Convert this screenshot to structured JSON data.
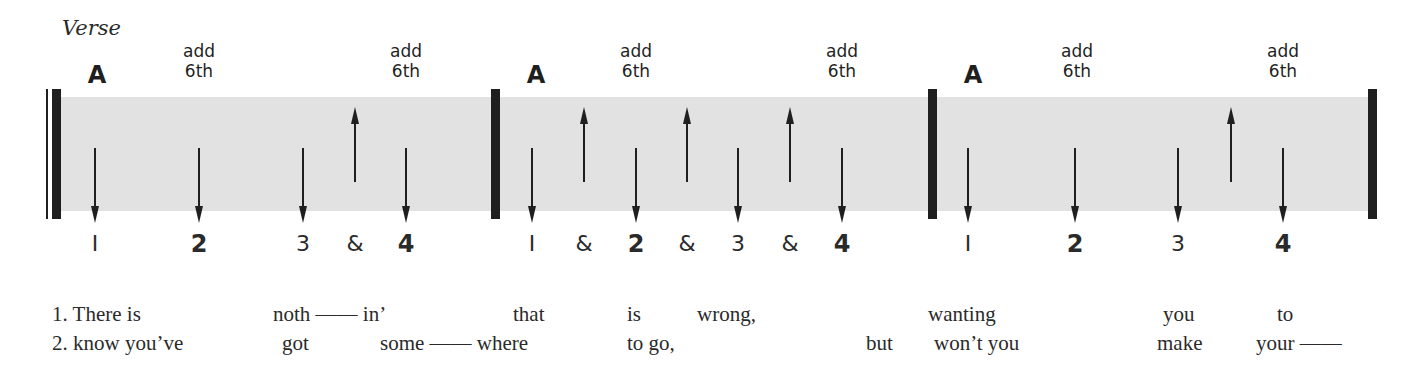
{
  "section_label": "Verse",
  "colors": {
    "band": "#e2e2e2",
    "ink": "#1f1f1f"
  },
  "bars": [
    {
      "chords": [
        {
          "name": "A",
          "x": 97,
          "type": "root"
        },
        {
          "name": "add\n6th",
          "line1": "add",
          "line2": "6th",
          "x": 199,
          "type": "ext"
        },
        {
          "line1": "add",
          "line2": "6th",
          "x": 406,
          "type": "ext"
        }
      ],
      "strums": [
        {
          "dir": "down",
          "x": 95
        },
        {
          "dir": "down",
          "x": 199
        },
        {
          "dir": "down",
          "x": 303
        },
        {
          "dir": "up",
          "x": 355
        },
        {
          "dir": "down",
          "x": 406
        }
      ],
      "beats": [
        {
          "label": "1",
          "x": 95,
          "strong": false
        },
        {
          "label": "2",
          "x": 199,
          "strong": true
        },
        {
          "label": "3",
          "x": 303,
          "strong": false
        },
        {
          "label": "&",
          "x": 355,
          "strong": false
        },
        {
          "label": "4",
          "x": 406,
          "strong": true
        }
      ]
    },
    {
      "chords": [
        {
          "name": "A",
          "x": 536,
          "type": "root"
        },
        {
          "line1": "add",
          "line2": "6th",
          "x": 636,
          "type": "ext"
        },
        {
          "line1": "add",
          "line2": "6th",
          "x": 842,
          "type": "ext"
        }
      ],
      "strums": [
        {
          "dir": "down",
          "x": 532
        },
        {
          "dir": "up",
          "x": 584
        },
        {
          "dir": "down",
          "x": 636
        },
        {
          "dir": "up",
          "x": 687
        },
        {
          "dir": "down",
          "x": 738
        },
        {
          "dir": "up",
          "x": 790
        },
        {
          "dir": "down",
          "x": 842
        }
      ],
      "beats": [
        {
          "label": "1",
          "x": 532,
          "strong": false
        },
        {
          "label": "&",
          "x": 584,
          "strong": false
        },
        {
          "label": "2",
          "x": 636,
          "strong": true
        },
        {
          "label": "&",
          "x": 687,
          "strong": false
        },
        {
          "label": "3",
          "x": 738,
          "strong": false
        },
        {
          "label": "&",
          "x": 790,
          "strong": false
        },
        {
          "label": "4",
          "x": 842,
          "strong": true
        }
      ]
    },
    {
      "chords": [
        {
          "name": "A",
          "x": 973,
          "type": "root"
        },
        {
          "line1": "add",
          "line2": "6th",
          "x": 1077,
          "type": "ext"
        },
        {
          "line1": "add",
          "line2": "6th",
          "x": 1283,
          "type": "ext"
        }
      ],
      "strums": [
        {
          "dir": "down",
          "x": 968
        },
        {
          "dir": "down",
          "x": 1075
        },
        {
          "dir": "down",
          "x": 1178
        },
        {
          "dir": "up",
          "x": 1231
        },
        {
          "dir": "down",
          "x": 1283
        }
      ],
      "beats": [
        {
          "label": "1",
          "x": 968,
          "strong": false
        },
        {
          "label": "2",
          "x": 1075,
          "strong": true
        },
        {
          "label": "3",
          "x": 1178,
          "strong": false
        },
        {
          "label": "4",
          "x": 1283,
          "strong": true
        }
      ]
    }
  ],
  "lyrics": {
    "line1": [
      {
        "text": "1. There is",
        "x": 52
      },
      {
        "text": "noth —— in’",
        "x": 273
      },
      {
        "text": "that",
        "x": 513
      },
      {
        "text": "is",
        "x": 627
      },
      {
        "text": "wrong,",
        "x": 697
      },
      {
        "text": "wanting",
        "x": 928
      },
      {
        "text": "you",
        "x": 1163
      },
      {
        "text": "to",
        "x": 1277
      }
    ],
    "line2": [
      {
        "text": "2. know you’ve",
        "x": 52
      },
      {
        "text": "got",
        "x": 282
      },
      {
        "text": "some —— where",
        "x": 380
      },
      {
        "text": "to go,",
        "x": 627
      },
      {
        "text": "but",
        "x": 866
      },
      {
        "text": "won’t you",
        "x": 934
      },
      {
        "text": "make",
        "x": 1157
      },
      {
        "text": "your ——",
        "x": 1256
      }
    ]
  }
}
